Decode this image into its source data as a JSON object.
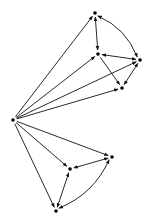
{
  "diagram": {
    "type": "directed-graph",
    "width": 147,
    "height": 222,
    "colors": {
      "background": "#ffffff",
      "stroke": "#111111",
      "node": "#000000"
    },
    "nodes": [
      {
        "id": "S",
        "x": 13,
        "y": 120
      },
      {
        "id": "A",
        "x": 95,
        "y": 13
      },
      {
        "id": "B",
        "x": 98,
        "y": 54
      },
      {
        "id": "C",
        "x": 140,
        "y": 60
      },
      {
        "id": "D",
        "x": 122,
        "y": 88
      },
      {
        "id": "E",
        "x": 112,
        "y": 157
      },
      {
        "id": "F",
        "x": 70,
        "y": 169
      },
      {
        "id": "G",
        "x": 56,
        "y": 211
      }
    ],
    "edges": [
      {
        "from": "S",
        "to": "A",
        "kind": "single",
        "curve": 0
      },
      {
        "from": "S",
        "to": "B",
        "kind": "single",
        "curve": 0
      },
      {
        "from": "S",
        "to": "C",
        "kind": "single",
        "curve": 0
      },
      {
        "from": "S",
        "to": "D",
        "kind": "single",
        "curve": 0
      },
      {
        "from": "S",
        "to": "E",
        "kind": "single",
        "curve": 0
      },
      {
        "from": "S",
        "to": "F",
        "kind": "single",
        "curve": 0
      },
      {
        "from": "S",
        "to": "G",
        "kind": "single",
        "curve": 0
      },
      {
        "from": "A",
        "to": "B",
        "kind": "double",
        "curve": 0
      },
      {
        "from": "A",
        "to": "C",
        "kind": "double",
        "curve": -12
      },
      {
        "from": "B",
        "to": "C",
        "kind": "double",
        "curve": 0
      },
      {
        "from": "B",
        "to": "D",
        "kind": "single",
        "curve": 0
      },
      {
        "from": "C",
        "to": "D",
        "kind": "double",
        "curve": 0
      },
      {
        "from": "E",
        "to": "F",
        "kind": "double",
        "curve": 0
      },
      {
        "from": "F",
        "to": "G",
        "kind": "double",
        "curve": 0
      },
      {
        "from": "E",
        "to": "G",
        "kind": "double",
        "curve": -14
      }
    ]
  }
}
